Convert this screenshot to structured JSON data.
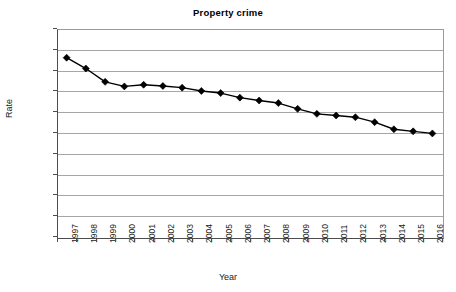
{
  "chart_data": {
    "type": "line",
    "title": "Property crime",
    "xlabel": "Year",
    "ylabel": "Rate",
    "grid": true,
    "legend": "none",
    "marker": "diamond",
    "series_color": "#000000",
    "grid_color": "#a6a6a6",
    "axis_color": "#4d4d4d",
    "xlim": [
      1997,
      2016
    ],
    "ylim": [
      0,
      5000
    ],
    "ytick_step": 500,
    "yticks": [
      5000,
      4500,
      4000,
      3500,
      3000,
      2500,
      2000,
      1500,
      1000,
      500,
      0
    ],
    "ytick_labels": [
      "5000",
      "4500",
      "4000",
      "3500",
      "3000",
      "2500",
      "2000",
      "1500",
      "1000",
      "500",
      "0"
    ],
    "categories": [
      1997,
      1998,
      1999,
      2000,
      2001,
      2002,
      2003,
      2004,
      2005,
      2006,
      2007,
      2008,
      2009,
      2010,
      2011,
      2012,
      2013,
      2014,
      2015,
      2016
    ],
    "xtick_labels": [
      "1997",
      "1998",
      "1999",
      "2000",
      "2001",
      "2002",
      "2003",
      "2004",
      "2005",
      "2006",
      "2007",
      "2008",
      "2009",
      "2010",
      "2011",
      "2012",
      "2013",
      "2014",
      "2015",
      "2016"
    ],
    "series": [
      {
        "name": "Property crime rate",
        "values": [
          4310,
          4050,
          3730,
          3620,
          3660,
          3630,
          3590,
          3510,
          3460,
          3350,
          3280,
          3220,
          3080,
          2960,
          2920,
          2880,
          2760,
          2590,
          2540,
          2490
        ]
      }
    ]
  }
}
